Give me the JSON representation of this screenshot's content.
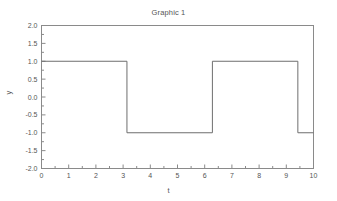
{
  "chart_data": {
    "type": "line",
    "title": "Graphic 1",
    "xlabel": "t",
    "ylabel": "y",
    "xlim": [
      0,
      10
    ],
    "ylim": [
      -2.0,
      2.0
    ],
    "grid": false,
    "legend": null,
    "xticks": [
      0,
      1,
      2,
      3,
      4,
      5,
      6,
      7,
      8,
      9,
      10
    ],
    "xtick_labels": [
      "0",
      "1",
      "2",
      "3",
      "4",
      "5",
      "6",
      "7",
      "8",
      "9",
      "10"
    ],
    "xminor_step": 0.5,
    "yticks": [
      -2.0,
      -1.5,
      -1.0,
      -0.5,
      0.0,
      0.5,
      1.0,
      1.5,
      2.0
    ],
    "ytick_labels": [
      "-2.0",
      "-1.5",
      "-1.0",
      "-0.5",
      "0.0",
      "0.5",
      "1.0",
      "1.5",
      "2.0"
    ],
    "yminor_step": 0.25,
    "line_color": "#6e6e6e",
    "frame_color": "#8a8a8a",
    "series": [
      {
        "name": "square wave",
        "x": [
          0,
          3.1416,
          3.1416,
          6.2832,
          6.2832,
          9.4248,
          9.4248,
          10
        ],
        "values": [
          1,
          1,
          -1,
          -1,
          1,
          1,
          -1,
          -1
        ]
      }
    ],
    "transitions": [
      3.1416,
      6.2832,
      9.4248
    ],
    "high_level": 1,
    "low_level": -1
  }
}
